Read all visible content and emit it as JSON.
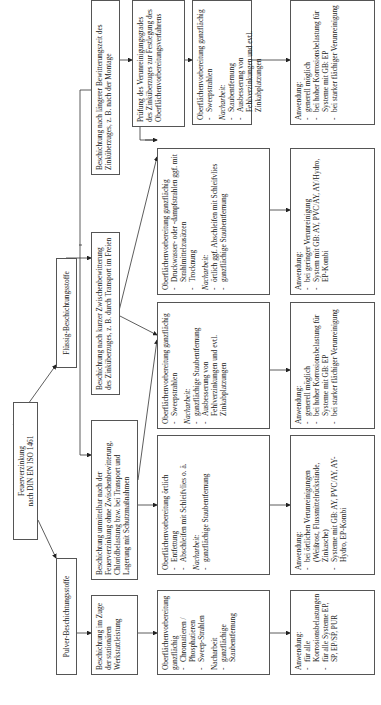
{
  "root": {
    "line1": "Feuerverzinkung",
    "line2": "nach DIN EN ISO 1461"
  },
  "branches": {
    "fluessig": "Flüssig-Beschichtungsstoffe",
    "pulver": "Pulver-Beschichtungsstoffe"
  },
  "level2": {
    "laenger": "Beschichtung nach längerer Bewitterungszeit des Zinküberzuges, z. B. nach der Montage",
    "kurzer": "Beschichtung nach kurzer Zwischenbewitterung des Zinküberzuges, z. B. durch Transport im Freien",
    "unmittelbar": "Beschichtung unmittelbar nach der Feuerverzinkung ohne Zwischenbewitterung, Chloridbelastung bzw. bei Transport und Lagerung mit Schutzmaßnahmen",
    "werkstatt": "Beschichtung im Zuge der stationären Werkstattleistung"
  },
  "pruefung": "Prüfung des Verunreinigungsgrades des Zinküberzuges zur Festlegung des Oberflächenvorbereitungsverfahrens",
  "prep": {
    "sweep_nach": {
      "title": "Oberflächenvorbereitung ganzflächig",
      "items": [
        "Sweepstrahlen"
      ],
      "nach_label": "Nacharbeit:",
      "nach_items": [
        "Staubentfernung",
        "Ausbesserung von Fehlverzinkungen und evtl. Zinkabplatzungen"
      ]
    },
    "druckwasser": {
      "title": "Oberflächenvorbereitung ganzflächig",
      "items": [
        "Druckwasser- oder -dampfstrahlen ggf. mit Strahlmittelzusätzen",
        "Trocknung"
      ],
      "nach_label": "Nacharbeit:",
      "nach_items": [
        "örtlich ggf. Abschleifen mit Schleifvlies",
        "ganzflächige Staubentfernung"
      ]
    },
    "sweep_kurz": {
      "title": "Oberflächenvorbereitung ganzflächig",
      "items": [
        "Sweepstrahlen"
      ],
      "nach_label": "Nacharbeit:",
      "nach_items": [
        "ganzflächige Staubentfernung",
        "Ausbesserung von Fehlverzinkungen und evtl. Zinkabplatzungen"
      ]
    },
    "oertlich": {
      "title": "Oberflächenvorbereitung örtlich",
      "items": [
        "Entfettung",
        "Abschleifen mit Schleifvlies o. ä."
      ],
      "nach_label": "Nacharbeit:",
      "nach_items": [
        "ganzflächige Staubentfernung"
      ]
    },
    "pulver": {
      "title": "Oberflächenvorbereitung ganzflächig",
      "items": [
        "Chromatieren / Phosphatieren",
        "Sweep-Strahlen"
      ],
      "nach_label": "Nacharbeit",
      "nach_items": [
        "ganzflächige Staubentfernung"
      ]
    }
  },
  "anwendung": {
    "a1": {
      "title": "Anwendung:",
      "items": [
        "generell möglich",
        "bei hoher Korrosionsbelastung für Systeme mit GB: EP",
        "bei starker flächiger Verunreinigung"
      ]
    },
    "a2": {
      "title": "Anwendung:",
      "items": [
        "bei geringer Verunreinigung",
        "System mit GB: AY, PVC/AY, AY/Hydro, EP-Kombi"
      ]
    },
    "a3": {
      "title": "Anwendung:",
      "items": [
        "generell möglich",
        "bei hoher Korrosionsbelastung für Systeme mit GB: EP",
        "bei starker flächiger Verunreinigung"
      ]
    },
    "a4": {
      "title": "Anwendung:",
      "items": [
        "bei örtlichen Verunreinigungen (Weißrost, Flussmittelrückstände, Zinkasche)",
        "Systeme mit GB: AY, PVC/AY, AY-Hydro, EP-Kombi"
      ]
    },
    "a5": {
      "title": "Anwendung:",
      "items": [
        "für alle Korrosionsbelastungen",
        "für alle Systeme EP, SP, EP/SP, PUR"
      ]
    }
  }
}
